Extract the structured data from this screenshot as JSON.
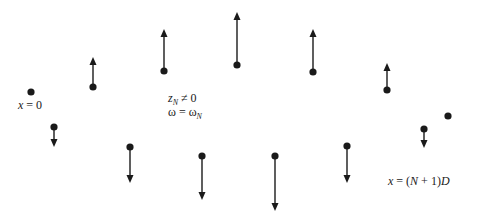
{
  "diagram": {
    "type": "standing-wave-mass-displacements",
    "colors": {
      "ink": "#1a1a1a",
      "background": "#ffffff"
    },
    "labels": {
      "left_end": {
        "var": "x",
        "eq": " = 0"
      },
      "condition_1": {
        "var": "z",
        "sub": "N",
        "rest": " ≠ 0"
      },
      "condition_2": {
        "var": "ω",
        "eq": " = ",
        "var2": "ω",
        "sub": "N"
      },
      "right_end": {
        "var": "x",
        "eq": " = (",
        "n": "N",
        "mid": " + 1)",
        "d": "D"
      }
    },
    "upper_row": [
      {
        "x": 31,
        "y": 92,
        "tip_y": null,
        "direction": "none"
      },
      {
        "x": 93,
        "y": 87,
        "tip_y": 57,
        "direction": "up"
      },
      {
        "x": 164,
        "y": 71,
        "tip_y": 29,
        "direction": "up"
      },
      {
        "x": 237,
        "y": 65,
        "tip_y": 12,
        "direction": "up"
      },
      {
        "x": 313,
        "y": 72,
        "tip_y": 29,
        "direction": "up"
      },
      {
        "x": 387,
        "y": 90,
        "tip_y": 63,
        "direction": "up"
      },
      {
        "x": 448,
        "y": 116,
        "tip_y": null,
        "direction": "none"
      }
    ],
    "lower_row": [
      {
        "x": 54,
        "y": 127,
        "tip_y": 147,
        "direction": "down"
      },
      {
        "x": 130,
        "y": 147,
        "tip_y": 183,
        "direction": "down"
      },
      {
        "x": 202,
        "y": 156,
        "tip_y": 200,
        "direction": "down"
      },
      {
        "x": 275,
        "y": 156,
        "tip_y": 211,
        "direction": "down"
      },
      {
        "x": 347,
        "y": 146,
        "tip_y": 183,
        "direction": "down"
      },
      {
        "x": 424,
        "y": 129,
        "tip_y": 148,
        "direction": "down"
      }
    ]
  }
}
